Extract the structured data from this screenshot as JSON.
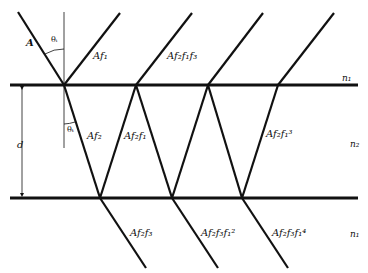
{
  "figure": {
    "colors": {
      "line": "#111111",
      "background": "#ffffff"
    },
    "labels": {
      "incident": "A",
      "reflected": [
        "Af₁",
        "Af₂f₁f₃",
        "",
        ""
      ],
      "internal": [
        "Af₂",
        "Af₂f₁",
        "Af₂f₁³"
      ],
      "transmitted": [
        "Af₂f₃",
        "Af₂f₃f₁²",
        "Af₂f₃f₁⁴"
      ],
      "theta_i": "θᵢ",
      "theta_t": "θₜ",
      "thickness": "d",
      "media": {
        "top": "n₁",
        "film": "n₂",
        "bottom": "n₁"
      }
    },
    "geometry": {
      "top_interface_y": 85,
      "bottom_interface_y": 198,
      "top_vertices_x": [
        64,
        136,
        208,
        278
      ],
      "bottom_vertices_x": [
        100,
        172,
        242
      ]
    }
  }
}
